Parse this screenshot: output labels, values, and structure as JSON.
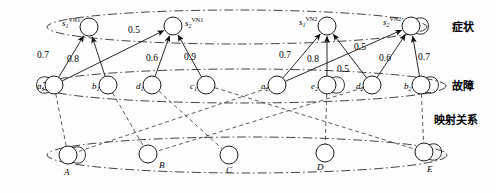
{
  "figure": {
    "kind": "layered-bipartite-mapping-diagram",
    "width": 496,
    "height": 193
  },
  "layers": [
    {
      "id": "symptom",
      "label": "症状",
      "label_x": 452,
      "label_y": 31
    },
    {
      "id": "fault",
      "label": "故障",
      "label_x": 452,
      "label_y": 90
    },
    {
      "id": "mapping",
      "label": "映射关系",
      "label_x": 434,
      "label_y": 124
    }
  ],
  "ellipses": [
    {
      "name": "symptom-ellipse",
      "cx": 237,
      "cy": 27,
      "rx": 190,
      "ry": 17
    },
    {
      "name": "fault-ellipse",
      "cx": 243,
      "cy": 86,
      "rx": 203,
      "ry": 17
    },
    {
      "name": "mapping-ellipse",
      "cx": 247,
      "cy": 155,
      "rx": 200,
      "ry": 18
    }
  ],
  "nodes": {
    "symptom": [
      {
        "id": "s1v1",
        "label": "s",
        "sub": "1",
        "sup": "VN1",
        "cx": 89,
        "cy": 27,
        "r": 9,
        "label_x": 62,
        "label_y": 26,
        "self_loop": false
      },
      {
        "id": "s2v1",
        "label": "s",
        "sub": "2",
        "sup": "VN1",
        "cx": 173,
        "cy": 26,
        "r": 9,
        "label_x": 185,
        "label_y": 26,
        "self_loop": false
      },
      {
        "id": "s1v2",
        "label": "s",
        "sub": "1",
        "sup": "VN2",
        "cx": 327,
        "cy": 26,
        "r": 9,
        "label_x": 299,
        "label_y": 25,
        "self_loop": false
      },
      {
        "id": "s2v2",
        "label": "s",
        "sub": "2",
        "sup": "VN2",
        "cx": 411,
        "cy": 26,
        "r": 9,
        "label_x": 383,
        "label_y": 25,
        "self_loop": true
      }
    ],
    "fault": [
      {
        "id": "a1",
        "label": "a",
        "sub": "1",
        "cx": 54,
        "cy": 85,
        "r": 9,
        "label_x": 37,
        "label_y": 89,
        "self_loop": true
      },
      {
        "id": "b1",
        "label": "b",
        "sub": "1",
        "cx": 108,
        "cy": 85,
        "r": 9,
        "label_x": 92,
        "label_y": 89,
        "self_loop": false
      },
      {
        "id": "d1",
        "label": "d",
        "sub": "1",
        "cx": 152,
        "cy": 85,
        "r": 9,
        "label_x": 136,
        "label_y": 89,
        "self_loop": false
      },
      {
        "id": "c1",
        "label": "c",
        "sub": "1",
        "cx": 206,
        "cy": 85,
        "r": 9,
        "label_x": 190,
        "label_y": 89,
        "self_loop": false
      },
      {
        "id": "a2",
        "label": "a",
        "sub": "2",
        "cx": 277,
        "cy": 85,
        "r": 9,
        "label_x": 261,
        "label_y": 89,
        "self_loop": false
      },
      {
        "id": "e2",
        "label": "e",
        "sub": "2",
        "cx": 327,
        "cy": 85,
        "r": 9,
        "label_x": 311,
        "label_y": 89,
        "self_loop": true
      },
      {
        "id": "d2",
        "label": "d",
        "sub": "2",
        "cx": 372,
        "cy": 85,
        "r": 9,
        "label_x": 356,
        "label_y": 89,
        "self_loop": false
      },
      {
        "id": "b2",
        "label": "b",
        "sub": "2",
        "cx": 421,
        "cy": 85,
        "r": 9,
        "label_x": 404,
        "label_y": 89,
        "self_loop": true
      }
    ],
    "mapping": [
      {
        "id": "A",
        "label": "A",
        "cx": 68,
        "cy": 155,
        "r": 9,
        "label_x": 64,
        "label_y": 175,
        "self_loop": true
      },
      {
        "id": "B",
        "label": "B",
        "cx": 148,
        "cy": 154,
        "r": 9,
        "label_x": 159,
        "label_y": 168,
        "self_loop": false
      },
      {
        "id": "C",
        "label": "C",
        "cx": 229,
        "cy": 155,
        "r": 9,
        "label_x": 226,
        "label_y": 173,
        "self_loop": false
      },
      {
        "id": "D",
        "label": "D",
        "cx": 325,
        "cy": 153,
        "r": 9,
        "label_x": 317,
        "label_y": 170,
        "self_loop": false
      },
      {
        "id": "E",
        "label": "E",
        "cx": 424,
        "cy": 152,
        "r": 9,
        "label_x": 427,
        "label_y": 172,
        "self_loop": true
      }
    ]
  },
  "weighted_edges": [
    {
      "from": "a1",
      "to": "s1v1",
      "weight": "0.7",
      "lx": 43,
      "ly": 58
    },
    {
      "from": "b1",
      "to": "s1v1",
      "weight": "0.8",
      "lx": 73,
      "ly": 62
    },
    {
      "from": "a1",
      "to": "s2v1",
      "weight": "0.5",
      "lx": 134,
      "ly": 33
    },
    {
      "from": "d1",
      "to": "s2v1",
      "weight": "0.6",
      "lx": 152,
      "ly": 61
    },
    {
      "from": "c1",
      "to": "s2v1",
      "weight": "0.9",
      "lx": 190,
      "ly": 60
    },
    {
      "from": "a2",
      "to": "s1v2",
      "weight": "0.7",
      "lx": 285,
      "ly": 58
    },
    {
      "from": "e2",
      "to": "s1v2",
      "weight": "0.8",
      "lx": 313,
      "ly": 62
    },
    {
      "from": "a2",
      "to": "s2v2",
      "weight": "0.5",
      "lx": 360,
      "ly": 50
    },
    {
      "from": "d2",
      "to": "s1v2",
      "weight": "0.5",
      "lx": 343,
      "ly": 72
    },
    {
      "from": "d2",
      "to": "s2v2",
      "weight": "0.6",
      "lx": 385,
      "ly": 61
    },
    {
      "from": "b2",
      "to": "s2v2",
      "weight": "0.7",
      "lx": 424,
      "ly": 60
    }
  ],
  "mapping_edges": [
    {
      "from": "a1",
      "to": "A"
    },
    {
      "from": "b1",
      "to": "B"
    },
    {
      "from": "d1",
      "to": "C"
    },
    {
      "from": "c1",
      "to": "E"
    },
    {
      "from": "a2",
      "to": "A"
    },
    {
      "from": "e2",
      "to": "D"
    },
    {
      "from": "d2",
      "to": "B"
    },
    {
      "from": "b2",
      "to": "E"
    }
  ]
}
